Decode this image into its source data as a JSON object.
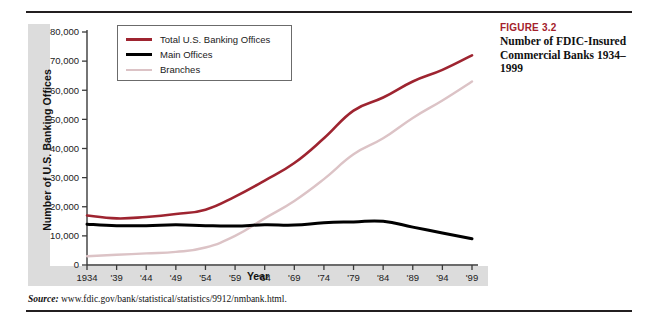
{
  "caption": {
    "figure_number": "FIGURE 3.2",
    "title": "Number of FDIC-Insured Commercial Banks 1934–1999"
  },
  "source": {
    "label": "Source:",
    "text": "www.fdic.gov/bank/statistical/statistics/9912/nmbank.html."
  },
  "colors": {
    "total": "#9e2430",
    "main": "#000000",
    "branches": "#dcc3c6",
    "figure_red": "#a4202a",
    "band_gray": "#dcdcdc",
    "axis": "#3a3a3a"
  },
  "chart_data": {
    "type": "line",
    "title": "Number of FDIC-Insured Commercial Banks 1934–1999",
    "xlabel": "Year",
    "ylabel": "Number of U.S. Banking Offices",
    "grid": false,
    "legend_position": "top-left",
    "xlim": [
      1934,
      1999
    ],
    "ylim": [
      0,
      80000
    ],
    "ytick_values": [
      0,
      10000,
      20000,
      30000,
      40000,
      50000,
      60000,
      70000,
      80000
    ],
    "ytick_labels": [
      "0",
      "10,000",
      "20,000",
      "30,000",
      "40,000",
      "50,000",
      "60,000",
      "70,000",
      "80,000"
    ],
    "categories": [
      1934,
      1939,
      1944,
      1949,
      1954,
      1959,
      1964,
      1969,
      1974,
      1979,
      1984,
      1989,
      1994,
      1999
    ],
    "xtick_labels": [
      "1934",
      "'39",
      "'44",
      "'49",
      "'54",
      "'59",
      "'64",
      "'69",
      "'74",
      "'79",
      "'84",
      "'89",
      "'94",
      "'99"
    ],
    "series": [
      {
        "name": "Total U.S. Banking Offices",
        "color": "#9e2430",
        "values": [
          17000,
          16000,
          16500,
          17500,
          19000,
          23500,
          29000,
          35000,
          43500,
          53000,
          57500,
          63000,
          67000,
          72000
        ]
      },
      {
        "name": "Main Offices",
        "color": "#000000",
        "values": [
          14000,
          13500,
          13500,
          13800,
          13500,
          13400,
          13800,
          13700,
          14500,
          14800,
          15000,
          13000,
          11000,
          9000
        ]
      },
      {
        "name": "Branches",
        "color": "#dcc3c6",
        "values": [
          3000,
          3500,
          4000,
          4500,
          6000,
          10000,
          16000,
          22000,
          29500,
          38000,
          43500,
          50500,
          56500,
          63000
        ]
      }
    ]
  },
  "legend": {
    "items": [
      {
        "label": "Total U.S. Banking Offices",
        "color": "#9e2430",
        "width": 3
      },
      {
        "label": "Main Offices",
        "color": "#000000",
        "width": 3.5
      },
      {
        "label": "Branches",
        "color": "#dcc3c6",
        "width": 2.5
      }
    ]
  }
}
